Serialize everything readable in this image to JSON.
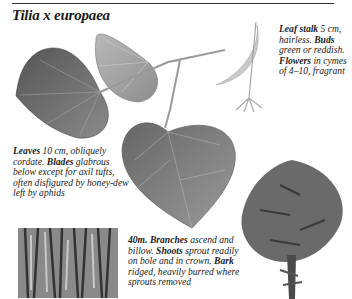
{
  "page": {
    "title": "Tilia x europaea"
  },
  "captions": {
    "leaves": {
      "leaves_label": "Leaves",
      "leaves_text": " 10 cm, obliquely cordate. ",
      "blades_label": "Blades",
      "blades_text": " glabrous below except for axil tufts, often disfigured by honey-dew left by aphids"
    },
    "side": {
      "leaf_stalk_label": "Leaf stalk",
      "leaf_stalk_text": " 5 cm, hairless. ",
      "buds_label": "Buds",
      "buds_text": " green or reddish. ",
      "flowers_label": "Flowers",
      "flowers_text": " in cymes of 4–10, fragrant"
    },
    "tree": {
      "height_label": "40m.",
      "branches_label": "Branches",
      "branches_text": " ascend and billow. ",
      "shoots_label": "Shoots",
      "shoots_text": " sprout readily on bole and in crown. ",
      "bark_label": "Bark",
      "bark_text": " ridged, heavily burred where sprouts removed"
    }
  },
  "illustrations": [
    {
      "name": "leaf-upper-dark"
    },
    {
      "name": "leaf-upper-light"
    },
    {
      "name": "leaf-lower"
    },
    {
      "name": "flower-bract"
    },
    {
      "name": "bark-texture"
    },
    {
      "name": "tree-silhouette"
    }
  ]
}
